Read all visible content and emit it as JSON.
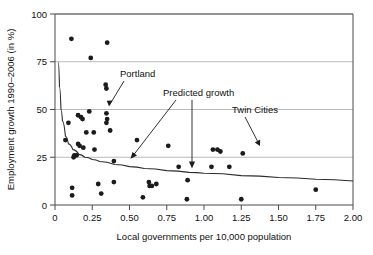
{
  "figure": {
    "background_color": "#ffffff",
    "frame_color": "#4a4a4a",
    "grid_color": "#a8a8a8",
    "point_color": "#1b1b1b",
    "curve_color": "#2b2b2b"
  },
  "chart_data": {
    "type": "scatter",
    "title": "",
    "subtitle": "",
    "xlabel": "Local governments per 10,000 population",
    "ylabel": "Employment growth 1990–2006 (in %)",
    "xlim": [
      0,
      2.0
    ],
    "ylim": [
      0,
      100
    ],
    "xticks": [
      0,
      0.25,
      0.5,
      0.75,
      1.0,
      1.25,
      1.5,
      1.75,
      2.0
    ],
    "xtick_labels": [
      "0",
      "0.25",
      "0.50",
      "0.75",
      "1.00",
      "1.25",
      "1.50",
      "1.75",
      "2.00"
    ],
    "yticks": [
      0,
      25,
      50,
      75,
      100
    ],
    "ytick_labels": [
      "0",
      "25",
      "50",
      "75",
      "100"
    ],
    "grid": "horizontal gridlines at y = 25, 50, 75, 100",
    "legend": "none",
    "series": [
      {
        "name": "Metropolitan areas",
        "marker": "filled circle",
        "points": [
          [
            0.11,
            87
          ],
          [
            0.35,
            85
          ],
          [
            0.24,
            77
          ],
          [
            0.34,
            63
          ],
          [
            0.345,
            61
          ],
          [
            0.23,
            49
          ],
          [
            0.345,
            48
          ],
          [
            0.155,
            47
          ],
          [
            0.175,
            46
          ],
          [
            0.185,
            45
          ],
          [
            0.35,
            45
          ],
          [
            0.09,
            43
          ],
          [
            0.345,
            43
          ],
          [
            0.21,
            38
          ],
          [
            0.26,
            38
          ],
          [
            0.37,
            39
          ],
          [
            0.07,
            34
          ],
          [
            0.55,
            34
          ],
          [
            0.155,
            32
          ],
          [
            0.165,
            31
          ],
          [
            0.19,
            30
          ],
          [
            0.265,
            29
          ],
          [
            0.76,
            31
          ],
          [
            1.06,
            29
          ],
          [
            1.09,
            29
          ],
          [
            1.11,
            28
          ],
          [
            1.26,
            27
          ],
          [
            0.13,
            26
          ],
          [
            0.145,
            26
          ],
          [
            0.125,
            25
          ],
          [
            0.395,
            23
          ],
          [
            0.83,
            20
          ],
          [
            1.05,
            20
          ],
          [
            1.17,
            20
          ],
          [
            0.89,
            13
          ],
          [
            0.29,
            11
          ],
          [
            0.395,
            12
          ],
          [
            0.63,
            12
          ],
          [
            0.68,
            11
          ],
          [
            0.635,
            10
          ],
          [
            0.65,
            10
          ],
          [
            0.115,
            9
          ],
          [
            1.75,
            8
          ],
          [
            0.31,
            6
          ],
          [
            0.115,
            5
          ],
          [
            0.59,
            4
          ],
          [
            0.885,
            3
          ],
          [
            1.25,
            3
          ]
        ]
      },
      {
        "name": "Predicted growth",
        "type": "line",
        "description": "Fitted declining curve, approximately y = 8.8 + 1.6/x",
        "points": [
          [
            0.022,
            75
          ],
          [
            0.03,
            62
          ],
          [
            0.04,
            50
          ],
          [
            0.05,
            44
          ],
          [
            0.07,
            36
          ],
          [
            0.09,
            32
          ],
          [
            0.12,
            29
          ],
          [
            0.16,
            26.5
          ],
          [
            0.2,
            25
          ],
          [
            0.25,
            23.8
          ],
          [
            0.3,
            22.8
          ],
          [
            0.4,
            21.2
          ],
          [
            0.5,
            20.1
          ],
          [
            0.6,
            19.1
          ],
          [
            0.75,
            18.0
          ],
          [
            0.9,
            17.1
          ],
          [
            1.0,
            16.6
          ],
          [
            1.25,
            15.4
          ],
          [
            1.5,
            14.4
          ],
          [
            1.75,
            13.5
          ],
          [
            2.0,
            12.6
          ]
        ]
      }
    ],
    "annotations": [
      {
        "label": "Portland",
        "text_x": 0.33,
        "text_y": 68,
        "arrow_to_x": 0.355,
        "arrow_to_y": 46.5
      },
      {
        "label": "Predicted growth",
        "text_x": 0.66,
        "text_y": 58,
        "arrows": [
          {
            "to_x": 0.5,
            "to_y": 24.0
          },
          {
            "to_x": 0.92,
            "to_y": 19.5
          }
        ]
      },
      {
        "label": "Twin Cities",
        "text_x": 1.09,
        "text_y": 44,
        "arrow_to_x": 1.075,
        "arrow_to_y": 31.5
      }
    ]
  }
}
